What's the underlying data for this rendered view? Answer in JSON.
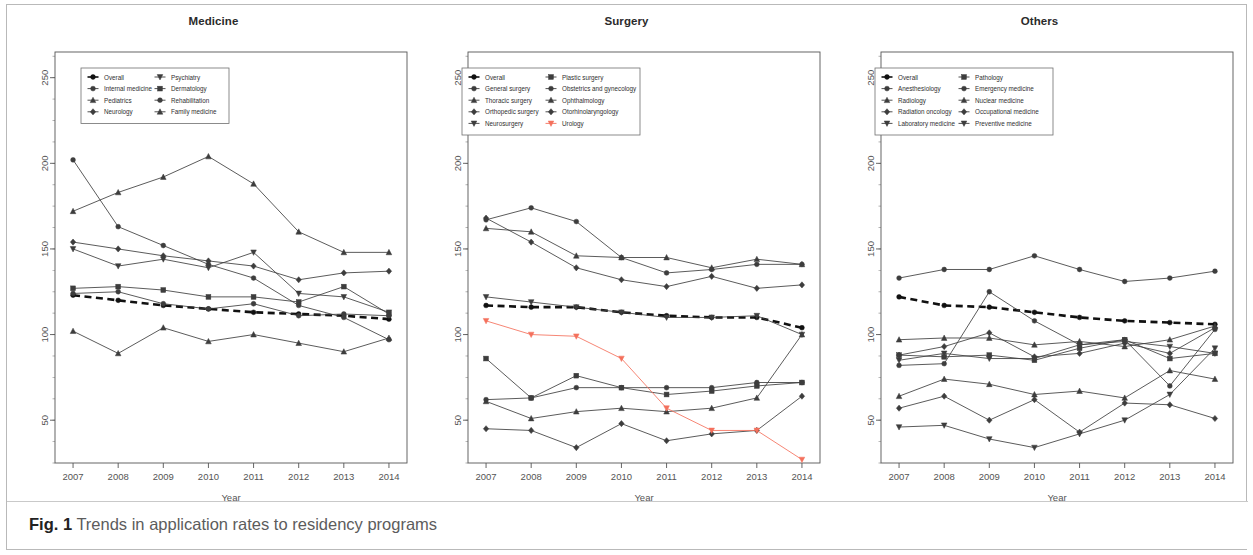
{
  "figure": {
    "caption_label": "Fig. 1",
    "caption_text": " Trends in application rates to residency programs"
  },
  "axis": {
    "xlabel": "Year",
    "xticks": [
      "2007",
      "2008",
      "2009",
      "2010",
      "2011",
      "2012",
      "2013",
      "2014"
    ],
    "yticks": [
      "50",
      "100",
      "150",
      "200",
      "250"
    ]
  },
  "colors": {
    "line": "#3d3d3d",
    "overall": "#111111",
    "urology": "#f4705c",
    "axis": "#555555",
    "frame": "#b9b9b9",
    "caption": "#5c5c5c"
  },
  "panels": [
    {
      "id": "medicine",
      "title": "Medicine",
      "legend": {
        "col1": [
          "Overall",
          "Internal medicine",
          "Pediatrics",
          "Neurology"
        ],
        "col2": [
          "Psychiatry",
          "Dermatology",
          "Rehabilitation",
          "Family medicine"
        ]
      }
    },
    {
      "id": "surgery",
      "title": "Surgery",
      "legend": {
        "col1": [
          "Overall",
          "General surgery",
          "Thoracic surgery",
          "Orthopedic surgery",
          "Neurosurgery"
        ],
        "col2": [
          "Plastic surgery",
          "Obstetrics and gynecology",
          "Ophthalmology",
          "Otorhinolaryngology",
          "Urology"
        ]
      }
    },
    {
      "id": "others",
      "title": "Others",
      "legend": {
        "col1": [
          "Overall",
          "Anesthesiology",
          "Radiology",
          "Radiation oncology",
          "Laboratory medicine"
        ],
        "col2": [
          "Pathology",
          "Emergency medicine",
          "Nuclear medicine",
          "Occupational medicine",
          "Preventive medicine"
        ]
      }
    }
  ],
  "chart_data": [
    {
      "type": "line",
      "title": "Medicine",
      "xlabel": "Year",
      "ylabel": "",
      "x": [
        2007,
        2008,
        2009,
        2010,
        2011,
        2012,
        2013,
        2014
      ],
      "xlim": [
        2006.6,
        2014.4
      ],
      "ylim": [
        25,
        265
      ],
      "grid": false,
      "legend_position": "top-left",
      "series": [
        {
          "name": "Overall",
          "style": "dashed",
          "color": "#111111",
          "values": [
            123,
            120,
            117,
            115,
            113,
            112,
            111,
            109
          ]
        },
        {
          "name": "Internal medicine",
          "values": [
            202,
            163,
            152,
            141,
            133,
            117,
            110,
            97
          ]
        },
        {
          "name": "Pediatrics",
          "values": [
            172,
            183,
            192,
            204,
            188,
            160,
            148,
            148
          ]
        },
        {
          "name": "Neurology",
          "values": [
            154,
            150,
            146,
            143,
            140,
            132,
            136,
            137
          ]
        },
        {
          "name": "Psychiatry",
          "values": [
            150,
            140,
            144,
            139,
            148,
            124,
            122,
            113
          ]
        },
        {
          "name": "Dermatology",
          "values": [
            127,
            128,
            126,
            122,
            122,
            119,
            128,
            112
          ]
        },
        {
          "name": "Rehabilitation",
          "values": [
            124,
            125,
            118,
            115,
            118,
            111,
            112,
            111
          ]
        },
        {
          "name": "Family medicine",
          "values": [
            102,
            89,
            104,
            96,
            100,
            95,
            90,
            98
          ]
        }
      ]
    },
    {
      "type": "line",
      "title": "Surgery",
      "xlabel": "Year",
      "ylabel": "",
      "x": [
        2007,
        2008,
        2009,
        2010,
        2011,
        2012,
        2013,
        2014
      ],
      "xlim": [
        2006.6,
        2014.4
      ],
      "ylim": [
        25,
        265
      ],
      "grid": false,
      "legend_position": "top-left",
      "series": [
        {
          "name": "Overall",
          "style": "dashed",
          "color": "#111111",
          "values": [
            117,
            116,
            116,
            113,
            111,
            110,
            110,
            104
          ]
        },
        {
          "name": "General surgery",
          "values": [
            167,
            174,
            166,
            145,
            136,
            138,
            141,
            141
          ]
        },
        {
          "name": "Thoracic surgery",
          "values": [
            162,
            160,
            146,
            145,
            145,
            139,
            144,
            141
          ]
        },
        {
          "name": "Orthopedic surgery",
          "values": [
            168,
            154,
            139,
            132,
            128,
            134,
            127,
            129
          ]
        },
        {
          "name": "Neurosurgery",
          "values": [
            122,
            119,
            116,
            113,
            110,
            110,
            111,
            100
          ]
        },
        {
          "name": "Plastic surgery",
          "values": [
            86,
            63,
            76,
            69,
            65,
            67,
            70,
            72
          ]
        },
        {
          "name": "Obstetrics and gynecology",
          "values": [
            62,
            63,
            69,
            69,
            69,
            69,
            72,
            72
          ]
        },
        {
          "name": "Ophthalmology",
          "values": [
            61,
            51,
            55,
            57,
            55,
            57,
            63,
            100
          ]
        },
        {
          "name": "Otorhinolaryngology",
          "values": [
            45,
            44,
            34,
            48,
            38,
            42,
            44,
            64
          ]
        },
        {
          "name": "Urology",
          "color": "#f4705c",
          "values": [
            108,
            100,
            99,
            86,
            57,
            44,
            44,
            27
          ]
        }
      ]
    },
    {
      "type": "line",
      "title": "Others",
      "xlabel": "Year",
      "ylabel": "",
      "x": [
        2007,
        2008,
        2009,
        2010,
        2011,
        2012,
        2013,
        2014
      ],
      "xlim": [
        2006.6,
        2014.4
      ],
      "ylim": [
        25,
        265
      ],
      "grid": false,
      "legend_position": "top-left",
      "series": [
        {
          "name": "Overall",
          "style": "dashed",
          "color": "#111111",
          "values": [
            122,
            117,
            116,
            113,
            110,
            108,
            107,
            106
          ]
        },
        {
          "name": "Anesthesiology",
          "values": [
            133,
            138,
            138,
            146,
            138,
            131,
            133,
            137
          ]
        },
        {
          "name": "Radiology",
          "values": [
            97,
            98,
            98,
            94,
            96,
            93,
            97,
            105
          ]
        },
        {
          "name": "Radiation oncology",
          "values": [
            88,
            93,
            101,
            87,
            89,
            95,
            89,
            104
          ]
        },
        {
          "name": "Laboratory medicine",
          "values": [
            85,
            89,
            86,
            86,
            94,
            96,
            93,
            89
          ]
        },
        {
          "name": "Pathology",
          "values": [
            88,
            87,
            88,
            85,
            92,
            97,
            86,
            89
          ]
        },
        {
          "name": "Emergency medicine",
          "values": [
            82,
            83,
            125,
            108,
            94,
            97,
            70,
            103
          ]
        },
        {
          "name": "Nuclear medicine",
          "values": [
            64,
            74,
            71,
            65,
            67,
            63,
            79,
            74
          ]
        },
        {
          "name": "Occupational medicine",
          "values": [
            57,
            64,
            50,
            62,
            43,
            60,
            59,
            51
          ]
        },
        {
          "name": "Preventive medicine",
          "values": [
            46,
            47,
            39,
            34,
            42,
            50,
            65,
            92
          ]
        }
      ]
    }
  ]
}
